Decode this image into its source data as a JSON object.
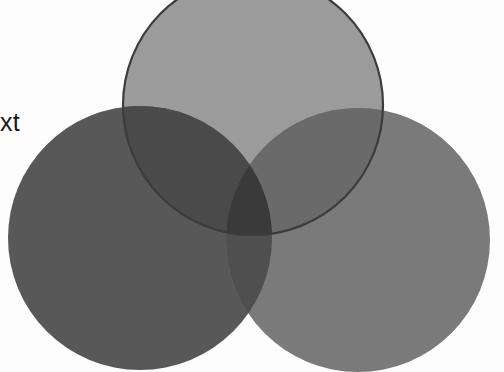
{
  "page": {
    "background_color": "#fdfdfd",
    "width": 504,
    "height": 372
  },
  "labels": [
    {
      "id": "clipped-left-label",
      "text": "ext",
      "full_text_guess": "Text",
      "color": "#1a1a1a",
      "x": -14,
      "y": 110,
      "font_size": 25,
      "clipped": "left"
    }
  ],
  "chart_data": {
    "type": "venn",
    "title": "",
    "set_count": 3,
    "grid": false,
    "legend": false,
    "background": "#fdfdfd",
    "sets": [
      {
        "name": "top",
        "cx": 253,
        "cy": 105,
        "r": 130,
        "fill": "#9b9b9b",
        "stroke": "#3c3c3c",
        "stroke_width": 2.2,
        "opacity": 1,
        "clipped": "top"
      },
      {
        "name": "left",
        "cx": 140,
        "cy": 238,
        "r": 132,
        "fill": "#585858",
        "stroke": "none",
        "stroke_width": 0,
        "opacity": 1,
        "clipped": "bottom"
      },
      {
        "name": "right",
        "cx": 358,
        "cy": 240,
        "r": 132,
        "fill": "#7a7a7a",
        "stroke": "none",
        "stroke_width": 0,
        "opacity": 1,
        "clipped": "bottom"
      }
    ],
    "regions": [
      {
        "key": "top_only",
        "label": "top only",
        "fill": "#9b9b9b"
      },
      {
        "key": "left_only",
        "label": "left only",
        "fill": "#585858"
      },
      {
        "key": "right_only",
        "label": "right only",
        "fill": "#7a7a7a"
      },
      {
        "key": "top_left",
        "label": "top ∩ left",
        "fill": "#4a4a4a"
      },
      {
        "key": "top_right",
        "label": "top ∩ right",
        "fill": "#6a6a6a"
      },
      {
        "key": "left_right",
        "label": "left ∩ right",
        "fill": "#4f4f4f"
      },
      {
        "key": "top_left_right",
        "label": "top ∩ left ∩ right",
        "fill": "#3a3a3a"
      }
    ]
  }
}
